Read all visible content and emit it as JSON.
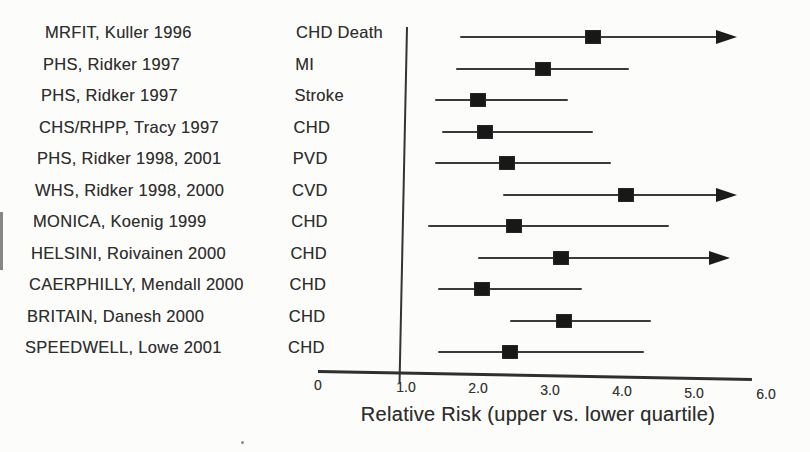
{
  "figure": {
    "background": "#fcfcfa",
    "ink_color": "#2e2e2e",
    "marker_color": "#181818"
  },
  "chart_data": {
    "type": "scatter",
    "subtype": "forest-plot",
    "title": "",
    "xlabel": "Relative Risk (upper vs. lower quartile)",
    "ylabel": "",
    "xlim": [
      0,
      6
    ],
    "grid": false,
    "reference_line_x": 1.0,
    "x_ticks": [
      {
        "value": 0,
        "label": "0"
      },
      {
        "value": 1.0,
        "label": "1.0"
      },
      {
        "value": 2.0,
        "label": "2.0"
      },
      {
        "value": 3.0,
        "label": "3.0"
      },
      {
        "value": 4.0,
        "label": "4.0"
      },
      {
        "value": 5.0,
        "label": "5.0"
      },
      {
        "value": 6.0,
        "label": "6.0"
      }
    ],
    "arrow_note": "arrow = upper confidence bound extends beyond axis",
    "rows": [
      {
        "study": "MRFIT, Kuller 1996",
        "outcome": "CHD Death",
        "rr": 3.6,
        "ci_low": 1.75,
        "ci_high": 5.6,
        "arrow": true
      },
      {
        "study": "PHS, Ridker 1997",
        "outcome": "MI",
        "rr": 2.9,
        "ci_low": 1.7,
        "ci_high": 4.1,
        "arrow": false
      },
      {
        "study": "PHS, Ridker 1997",
        "outcome": "Stroke",
        "rr": 2.0,
        "ci_low": 1.4,
        "ci_high": 3.25,
        "arrow": false
      },
      {
        "study": "CHS/RHPP, Tracy 1997",
        "outcome": "CHD",
        "rr": 2.1,
        "ci_low": 1.5,
        "ci_high": 3.6,
        "arrow": false
      },
      {
        "study": "PHS, Ridker 1998, 2001",
        "outcome": "PVD",
        "rr": 2.4,
        "ci_low": 1.4,
        "ci_high": 3.85,
        "arrow": false
      },
      {
        "study": "WHS, Ridker 1998, 2000",
        "outcome": "CVD",
        "rr": 4.05,
        "ci_low": 2.35,
        "ci_high": 5.6,
        "arrow": true
      },
      {
        "study": "MONICA, Koenig 1999",
        "outcome": "CHD",
        "rr": 2.5,
        "ci_low": 1.3,
        "ci_high": 4.65,
        "arrow": false
      },
      {
        "study": "HELSINI, Roivainen 2000",
        "outcome": "CHD",
        "rr": 3.15,
        "ci_low": 2.0,
        "ci_high": 5.5,
        "arrow": true
      },
      {
        "study": "CAERPHILLY, Mendall 2000",
        "outcome": "CHD",
        "rr": 2.05,
        "ci_low": 1.45,
        "ci_high": 3.45,
        "arrow": false
      },
      {
        "study": "BRITAIN, Danesh 2000",
        "outcome": "CHD",
        "rr": 3.2,
        "ci_low": 2.45,
        "ci_high": 4.4,
        "arrow": false
      },
      {
        "study": "SPEEDWELL, Lowe 2001",
        "outcome": "CHD",
        "rr": 2.45,
        "ci_low": 1.45,
        "ci_high": 4.3,
        "arrow": false
      }
    ]
  }
}
